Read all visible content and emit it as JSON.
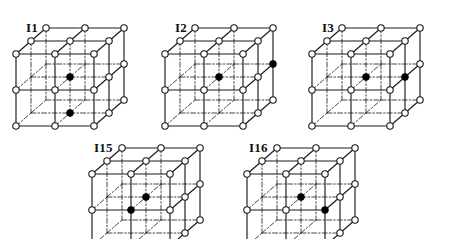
{
  "figure": {
    "background_color": "#ffffff",
    "line_color": "#1a1a1a",
    "node_fill": "#ffffff",
    "node_stroke": "#1a1a1a",
    "marked_fill": "#000000",
    "geometry": {
      "divisions": 2,
      "cell_width": 78,
      "cell_height": 72,
      "depth_dx": 30,
      "depth_dy": -26,
      "node_radius": 3.2,
      "marked_radius": 3.4,
      "edge_width": 1.15,
      "hidden_dash": "5,2,1.6,2"
    },
    "panels": [
      {
        "id": "I1",
        "label": "I1",
        "x": 14,
        "y": 14,
        "label_x": 12,
        "label_y": 6,
        "clip_bottom": 104,
        "marked": [
          {
            "i": 1,
            "j": 1,
            "k": 1
          },
          {
            "i": 1,
            "j": 2,
            "k": 1
          }
        ]
      },
      {
        "id": "I2",
        "label": "I2",
        "x": 163,
        "y": 14,
        "label_x": 12,
        "label_y": 6,
        "clip_bottom": 104,
        "marked": [
          {
            "i": 1,
            "j": 1,
            "k": 1
          },
          {
            "i": 2,
            "j": 1,
            "k": 2
          }
        ]
      },
      {
        "id": "I3",
        "label": "I3",
        "x": 310,
        "y": 14,
        "label_x": 12,
        "label_y": 6,
        "clip_bottom": 104,
        "marked": [
          {
            "i": 1,
            "j": 1,
            "k": 1
          },
          {
            "i": 2,
            "j": 1,
            "k": 1
          }
        ]
      },
      {
        "id": "I15",
        "label": "I15",
        "x": 90,
        "y": 134,
        "label_x": 4,
        "label_y": 6,
        "clip_bottom": 104,
        "marked": [
          {
            "i": 1,
            "j": 1,
            "k": 1
          },
          {
            "i": 1,
            "j": 1,
            "k": 0
          }
        ]
      },
      {
        "id": "I16",
        "label": "I16",
        "x": 245,
        "y": 134,
        "label_x": 4,
        "label_y": 6,
        "clip_bottom": 104,
        "marked": [
          {
            "i": 1,
            "j": 1,
            "k": 1
          },
          {
            "i": 2,
            "j": 1,
            "k": 0
          }
        ]
      }
    ]
  }
}
